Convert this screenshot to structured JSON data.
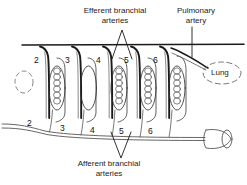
{
  "diagram": {
    "title_efferent": "Efferent branchial\narteries",
    "labels": {
      "efferent_line1": "Efferent branchial",
      "efferent_line2": "arteries",
      "afferent_line1": "Afferent branchial",
      "afferent_line2": "arteries",
      "pulmonary_line1": "Pulmonary",
      "pulmonary_line2": "artery",
      "lung": "Lung"
    },
    "arch_numbers_top": [
      "2",
      "3",
      "4",
      "5",
      "6"
    ],
    "arch_numbers_bottom": [
      "2",
      "3",
      "4",
      "5",
      "6"
    ],
    "vestigial_arch": {
      "present": true,
      "style": "dashed-ellipse",
      "label": ""
    },
    "gills": [
      {
        "index": 1,
        "beaded": true
      },
      {
        "index": 2,
        "beaded": false
      },
      {
        "index": 3,
        "beaded": true
      },
      {
        "index": 4,
        "beaded": true
      },
      {
        "index": 5,
        "beaded": true
      }
    ],
    "structures": {
      "dorsal_aorta": "dorsal aorta",
      "ventral_aorta": "ventral aorta",
      "heart": "heart",
      "lung_outline": "lung"
    },
    "colors": {
      "ink": "#1a1a1a",
      "line_light": "#6a6a6a",
      "background": "#ffffff"
    }
  }
}
